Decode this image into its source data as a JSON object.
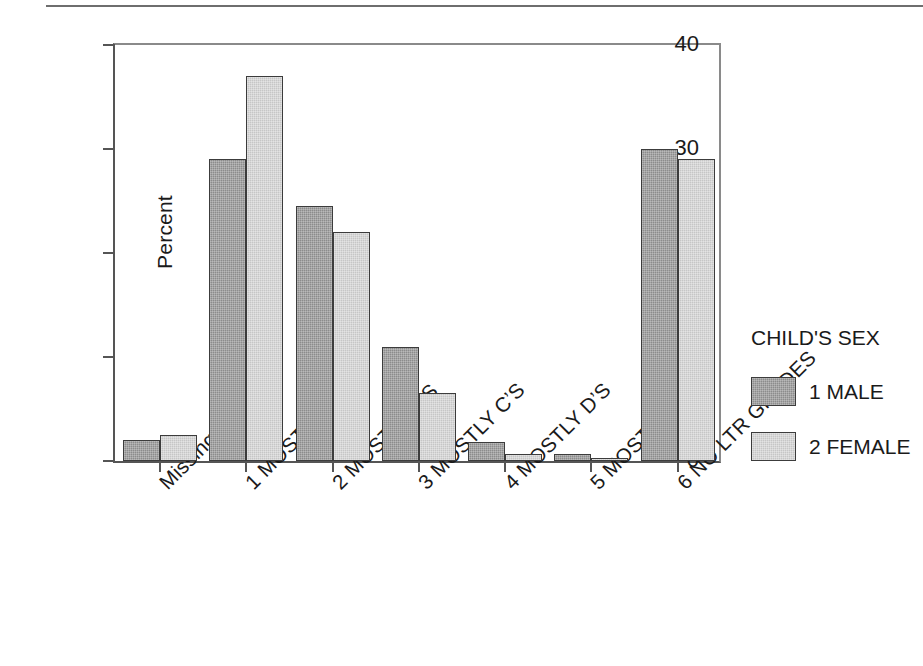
{
  "chart_data": {
    "type": "bar",
    "title": "",
    "xlabel": "",
    "ylabel": "Percent",
    "ylim": [
      0,
      40
    ],
    "yticks": [
      0,
      10,
      20,
      30,
      40
    ],
    "ytick_labels": [
      "0",
      "10",
      "20",
      "30",
      "40"
    ],
    "grid": false,
    "legend_position": "right",
    "legend_title": "CHILD'S SEX",
    "categories": [
      "Missing",
      "1  MOSTLY A’S",
      "2  MOSTLY B’S",
      "3  MOSTLY C’S",
      "4  MOSTLY D’S",
      "5  MOSTLY F’S",
      "6  NO LTR GRADES"
    ],
    "series": [
      {
        "name": "1 MALE",
        "color": "#8c8c8c",
        "values": [
          2.0,
          29.0,
          24.5,
          11.0,
          1.8,
          0.7,
          30.0
        ]
      },
      {
        "name": "2 FEMALE",
        "color": "#c6c6c6",
        "values": [
          2.5,
          37.0,
          22.0,
          6.5,
          0.7,
          0.3,
          29.0
        ]
      }
    ]
  },
  "legend": {
    "title": "CHILD'S SEX",
    "entries": [
      {
        "label": "1 MALE",
        "swatch": "male"
      },
      {
        "label": "2 FEMALE",
        "swatch": "female"
      }
    ]
  },
  "axes": {
    "y_label": "Percent"
  }
}
